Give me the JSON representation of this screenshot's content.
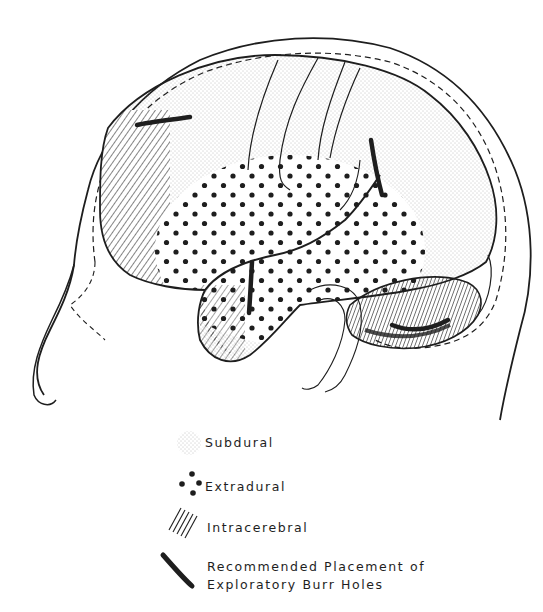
{
  "figure": {
    "regions": [
      {
        "name": "Subdural",
        "pattern": "fine-stipple",
        "location": "frontal and parietal convexity"
      },
      {
        "name": "Extradural",
        "pattern": "large-dots",
        "location": "temporal region"
      },
      {
        "name": "Intracerebral",
        "pattern": "diagonal-hatch",
        "location": "frontal pole, temporal lobe, cerebellum"
      }
    ],
    "burr_holes": [
      {
        "location": "frontal"
      },
      {
        "location": "parietal"
      },
      {
        "location": "temporal"
      },
      {
        "location": "posterior fossa"
      }
    ]
  },
  "legend": {
    "items": [
      {
        "label": "Subdural",
        "symbol": "fine-stipple"
      },
      {
        "label": "Extradural",
        "symbol": "large-dots"
      },
      {
        "label": "Intracerebral",
        "symbol": "diagonal-hatch"
      },
      {
        "label": "Recommended Placement of\nExploratory Burr Holes",
        "symbol": "thick-stroke"
      }
    ]
  },
  "colors": {
    "ink": "#1e1e1e",
    "background": "#ffffff",
    "stipple": "#6a6a6a"
  }
}
